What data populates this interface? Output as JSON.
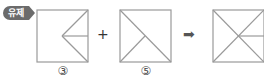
{
  "badge": {
    "text": "유제"
  },
  "operators": {
    "plus": "+",
    "result_arrow": "➡"
  },
  "figures": [
    {
      "label": "③",
      "lines": "square with two lines from right corners meeting at center and a horizontal line from center to right edge midpoint"
    },
    {
      "label": "⑤",
      "lines": "square with diagonal from top-left to bottom-right and line from bottom-left to center"
    },
    {
      "label": "",
      "lines": "square with both diagonals and horizontal line from center to right edge midpoint"
    }
  ],
  "colors": {
    "line": "#8c8c8c",
    "badge": "#6b6b6b"
  }
}
